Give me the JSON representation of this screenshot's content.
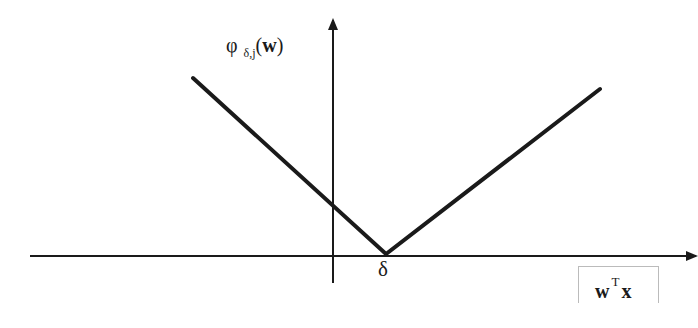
{
  "diagram": {
    "type": "function-plot",
    "y_axis_label": {
      "symbol": "φ",
      "subscript": "δ,j",
      "argument": "w"
    },
    "x_axis_label": {
      "base": "w",
      "superscript": "T",
      "tail": "x"
    },
    "vertex_label": "δ",
    "line_color": "#1a1a1a"
  }
}
